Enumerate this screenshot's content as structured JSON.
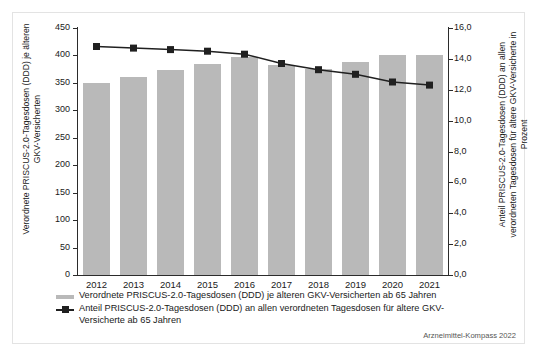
{
  "chart_data": {
    "type": "bar",
    "title": "",
    "subtitle": "",
    "xlabel": "",
    "ylabel": "Verordnete PRISCUS-2.0-Tagesdosen (DDD) je älteren GKV-Versicherten",
    "ylabel_right": "Anteil PRISCUS-2.0-Tagesdosen (DDD) an allen verordneten Tagesdosen für ältere GKV-Versicherte in Prozent",
    "categories": [
      "2012",
      "2013",
      "2014",
      "2015",
      "2016",
      "2017",
      "2018",
      "2019",
      "2020",
      "2021"
    ],
    "ylim": [
      0,
      450
    ],
    "ylim_right": [
      0,
      16
    ],
    "yticks": [
      "450",
      "400",
      "350",
      "300",
      "250",
      "200",
      "150",
      "100",
      "50",
      "0"
    ],
    "ytick_values": [
      450,
      400,
      350,
      300,
      250,
      200,
      150,
      100,
      50,
      0
    ],
    "yticks_right": [
      "16,0",
      "14,0",
      "12,0",
      "10,0",
      "8,0",
      "6,0",
      "4,0",
      "2,0",
      "0,0"
    ],
    "ytick_values_right": [
      16,
      14,
      12,
      10,
      8,
      6,
      4,
      2,
      0
    ],
    "grid": false,
    "legend_position": "below",
    "series": [
      {
        "name": "Verordnete PRISCUS-2.0-Tagesdosen (DDD) je älteren GKV-Versicherten ab 65 Jahren",
        "type": "bar",
        "axis": "left",
        "color": "#b9b9b9",
        "values": [
          350,
          360,
          374,
          384,
          397,
          383,
          375,
          388,
          401,
          400
        ]
      },
      {
        "name": "Anteil PRISCUS-2.0-Tagesdosen (DDD) an allen verordneten Tagesdosen für ältere GKV-Versicherte ab 65 Jahren",
        "type": "line",
        "axis": "right",
        "color": "#202020",
        "marker": "square",
        "values": [
          14.8,
          14.7,
          14.6,
          14.5,
          14.3,
          13.7,
          13.3,
          13.0,
          12.5,
          12.3
        ]
      }
    ]
  },
  "legend": {
    "items": [
      {
        "marker": "bar-swatch",
        "label": "Verordnete PRISCUS-2.0-Tagesdosen (DDD) je älteren GKV-Versicherten ab 65 Jahren"
      },
      {
        "marker": "line-square-marker",
        "label": "Anteil PRISCUS-2.0-Tagesdosen (DDD) an allen verordneten Tagesdosen für ältere GKV-Versicherte ab 65 Jahren"
      }
    ]
  },
  "source": "Arzneimittel-Kompass 2022",
  "colors": {
    "bar": "#b9b9b9",
    "line": "#202020",
    "axis": "#2b2b2b",
    "frame": "#e3e3e3",
    "background": "#ffffff"
  }
}
